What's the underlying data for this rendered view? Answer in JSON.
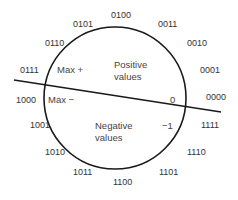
{
  "diagram": {
    "colors": {
      "stroke": "#1a1a1a",
      "text": "#333333",
      "background": "#ffffff"
    },
    "circle": {
      "cx": 115,
      "cy": 98,
      "r": 71
    },
    "divider": {
      "x1": 14,
      "y1": 80,
      "x2": 221,
      "y2": 112
    },
    "codes": [
      {
        "text": "0100",
        "x": 111,
        "y": 18
      },
      {
        "text": "0011",
        "x": 158,
        "y": 27
      },
      {
        "text": "0010",
        "x": 187,
        "y": 46
      },
      {
        "text": "0001",
        "x": 200,
        "y": 73
      },
      {
        "text": "0000",
        "x": 206,
        "y": 100
      },
      {
        "text": "1111",
        "x": 201,
        "y": 128
      },
      {
        "text": "1110",
        "x": 187,
        "y": 155
      },
      {
        "text": "1101",
        "x": 159,
        "y": 175
      },
      {
        "text": "1100",
        "x": 113,
        "y": 185
      },
      {
        "text": "1011",
        "x": 73,
        "y": 175
      },
      {
        "text": "1010",
        "x": 45,
        "y": 155
      },
      {
        "text": "1001",
        "x": 30,
        "y": 128
      },
      {
        "text": "1000",
        "x": 16,
        "y": 103
      },
      {
        "text": "0111",
        "x": 20,
        "y": 73
      },
      {
        "text": "0110",
        "x": 45,
        "y": 46
      },
      {
        "text": "0101",
        "x": 73,
        "y": 27
      }
    ],
    "annotations": {
      "max_pos": "Max +",
      "max_neg": "Max −",
      "zero": "0",
      "minus_one": "−1",
      "positive_line1": "Positive",
      "positive_line2": "values",
      "negative_line1": "Negative",
      "negative_line2": "values"
    }
  }
}
